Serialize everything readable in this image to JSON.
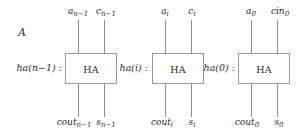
{
  "figure": {
    "label": "A",
    "ha_box_text": "HA"
  },
  "cells": [
    {
      "id": "ha-n-minus-1",
      "name": "ha(n−1) :",
      "inputs": [
        {
          "base": "a",
          "sub": "n−1",
          "name": "input-a-n-minus-1"
        },
        {
          "base": "c",
          "sub": "n−1",
          "name": "input-c-n-minus-1"
        }
      ],
      "outputs": [
        {
          "base": "cout",
          "sub": "n−1",
          "name": "output-cout-n-minus-1"
        },
        {
          "base": "s",
          "sub": "n−1",
          "name": "output-s-n-minus-1"
        }
      ]
    },
    {
      "id": "ha-i",
      "name": "ha(i) :",
      "inputs": [
        {
          "base": "a",
          "sub": "i",
          "name": "input-a-i"
        },
        {
          "base": "c",
          "sub": "i",
          "name": "input-c-i"
        }
      ],
      "outputs": [
        {
          "base": "cout",
          "sub": "i",
          "name": "output-cout-i"
        },
        {
          "base": "s",
          "sub": "i",
          "name": "output-s-i"
        }
      ]
    },
    {
      "id": "ha-0",
      "name": "ha(0) :",
      "inputs": [
        {
          "base": "a",
          "sub": "0",
          "name": "input-a-0"
        },
        {
          "base": "cin",
          "sub": "0",
          "name": "input-cin-0"
        }
      ],
      "outputs": [
        {
          "base": "cout",
          "sub": "0",
          "name": "output-cout-0"
        },
        {
          "base": "s",
          "sub": "0",
          "name": "output-s-0"
        }
      ]
    }
  ],
  "colors": {
    "wire": "#8d8d8d",
    "box_border": "#9a9a9a",
    "text": "#2b2b2b",
    "background": "#ffffff"
  }
}
